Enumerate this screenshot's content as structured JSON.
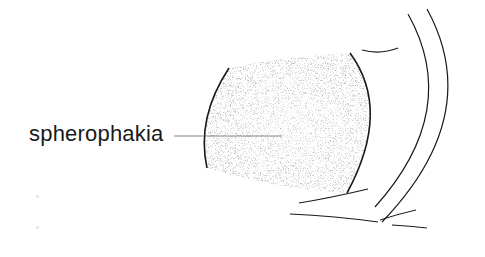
{
  "figure": {
    "label": "spherophakia",
    "colors": {
      "ink": "#1a1a1a",
      "stipple": "#3a3a3a",
      "background": "#ffffff"
    }
  }
}
